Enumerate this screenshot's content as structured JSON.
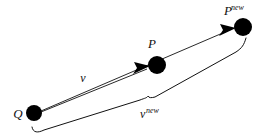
{
  "figure": {
    "background_color": "#ffffff",
    "ink_color": "#111111",
    "nodes": [
      {
        "id": "Q",
        "label": "Q",
        "superscript": "",
        "cx": 34,
        "cy": 113,
        "r": 8,
        "label_x": 18,
        "label_y": 118
      },
      {
        "id": "P",
        "label": "P",
        "superscript": "",
        "cx": 157,
        "cy": 65,
        "r": 9,
        "label_x": 150,
        "label_y": 48
      },
      {
        "id": "Pnew",
        "label": "P",
        "superscript": "new",
        "cx": 243,
        "cy": 27,
        "r": 9,
        "label_x": 222,
        "label_y": 13
      }
    ],
    "vectors": [
      {
        "id": "v",
        "label": "v",
        "superscript": "",
        "from": "Q",
        "to": "P",
        "label_x": 83,
        "label_y": 80
      },
      {
        "id": "vnew",
        "label": "v",
        "superscript": "new",
        "from": "Q",
        "to": "Pnew",
        "label_x": 146,
        "label_y": 115
      }
    ],
    "brace": {
      "name": "v-new-brace",
      "left_tip_x": 32,
      "left_tip_y": 127,
      "cusp_x": 148,
      "cusp_y": 97,
      "right_tip_x": 246,
      "right_tip_y": 38
    }
  }
}
